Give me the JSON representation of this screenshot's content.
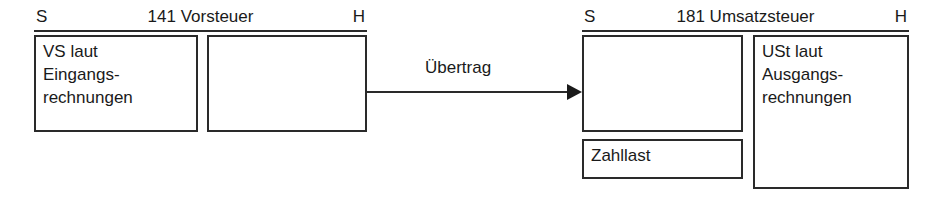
{
  "diagram": {
    "line_color": "#2a2a2a",
    "text_color": "#1a1a1a",
    "background": "#ffffff"
  },
  "accounts": [
    {
      "id": "vorsteuer",
      "number": "141",
      "name": "Vorsteuer",
      "title": "141 Vorsteuer",
      "debit_label": "S",
      "credit_label": "H",
      "debit_entries": [
        {
          "id": "vs-eingangsrechnungen",
          "text": "VS laut\nEingangs-\nrechnungen"
        }
      ],
      "credit_entries": [
        {
          "id": "vorsteuer-haben-empty",
          "text": ""
        }
      ]
    },
    {
      "id": "umsatzsteuer",
      "number": "181",
      "name": "Umsatzsteuer",
      "title": "181 Umsatzsteuer",
      "debit_label": "S",
      "credit_label": "H",
      "debit_entries": [
        {
          "id": "uebertrag-empfang",
          "text": ""
        },
        {
          "id": "zahllast",
          "text": "Zahllast"
        }
      ],
      "credit_entries": [
        {
          "id": "ust-ausgangsrechnungen",
          "text": "USt laut\nAusgangs-\nrechnungen"
        }
      ]
    }
  ],
  "arrow": {
    "label": "Übertrag",
    "from_account": "vorsteuer",
    "to_account": "umsatzsteuer",
    "direction": "right"
  }
}
